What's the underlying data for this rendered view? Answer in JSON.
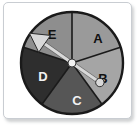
{
  "card": {
    "background": "#ffffff",
    "border_color": "#c9cdd2"
  },
  "spinner": {
    "title": "five-sector spinner",
    "outline_color": "#1a1a1a",
    "hub_color": "#f2f2f2",
    "pointer_color": "#d8d8d8",
    "pointer_outline": "#2b2b2b",
    "center": {
      "x": 53,
      "y": 53
    },
    "radius": 51,
    "sectors": [
      {
        "label": "A",
        "fill": "#9a9a9a",
        "text_color": "#111111",
        "start_deg": 0,
        "end_deg": 72,
        "label_x": 79,
        "label_y": 30
      },
      {
        "label": "B",
        "fill": "#a5a5a5",
        "text_color": "#111111",
        "start_deg": 72,
        "end_deg": 144,
        "label_x": 84,
        "label_y": 70
      },
      {
        "label": "C",
        "fill": "#565656",
        "text_color": "#f2f2f2",
        "start_deg": 144,
        "end_deg": 216,
        "label_x": 58,
        "label_y": 92
      },
      {
        "label": "D",
        "fill": "#2e2e2e",
        "text_color": "#f2f2f2",
        "start_deg": 216,
        "end_deg": 288,
        "label_x": 24,
        "label_y": 68
      },
      {
        "label": "E",
        "fill": "#8e8e8e",
        "text_color": "#111111",
        "start_deg": 288,
        "end_deg": 360,
        "label_x": 33,
        "label_y": 26
      }
    ],
    "arms": [
      {
        "name": "arrow-arm",
        "points_to": "E",
        "angle_deg": 305,
        "length": 44,
        "tip": "arrowhead"
      },
      {
        "name": "knob-arm",
        "points_to": "B",
        "angle_deg": 125,
        "length": 34,
        "tip": "round-knob"
      }
    ]
  }
}
